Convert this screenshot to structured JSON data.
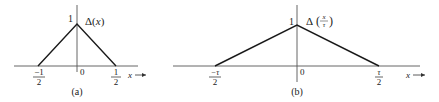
{
  "figure": {
    "panels": [
      {
        "id": "a",
        "caption": "(a)",
        "function_label": "Δ(x)",
        "function_name": "Δ",
        "function_arg": "x",
        "peak_label": "1",
        "origin_label": "0",
        "axis_label": "x",
        "left_tick": {
          "num": "−1",
          "den": "2"
        },
        "right_tick": {
          "num": "1",
          "den": "2"
        }
      },
      {
        "id": "b",
        "caption": "(b)",
        "function_label": "Δ(x/τ)",
        "function_name": "Δ",
        "function_arg_num": "x",
        "function_arg_den": "τ",
        "peak_label": "1",
        "origin_label": "0",
        "axis_label": "x",
        "left_tick": {
          "num": "−τ",
          "den": "2"
        },
        "right_tick": {
          "num": "τ",
          "den": "2"
        }
      }
    ],
    "colors": {
      "line": "#1a1a1a",
      "axis": "#555555",
      "text": "#222222"
    }
  }
}
